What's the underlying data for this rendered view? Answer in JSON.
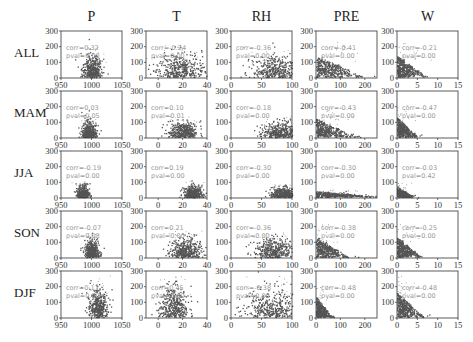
{
  "chart_data": {
    "type": "scatter",
    "title": "",
    "layout": {
      "rows": 5,
      "cols": 5,
      "grid": false,
      "legend": "none"
    },
    "col_titles": [
      "P",
      "T",
      "RH",
      "PRE",
      "W"
    ],
    "row_labels": [
      "ALL",
      "MAM",
      "JJA",
      "SON",
      "DJF"
    ],
    "ylim": [
      0,
      300
    ],
    "yticks": [
      0,
      100,
      200,
      300
    ],
    "xaxes": {
      "P": {
        "xlim": [
          950,
          1050
        ],
        "xticks": [
          950,
          1000,
          1050
        ]
      },
      "T": {
        "xlim": [
          -10,
          40
        ],
        "xticks": [
          0,
          20,
          40
        ]
      },
      "RH": {
        "xlim": [
          0,
          100
        ],
        "xticks": [
          0,
          50,
          100
        ]
      },
      "PRE": {
        "xlim": [
          0,
          250
        ],
        "xticks": [
          0,
          100,
          200
        ]
      },
      "W": {
        "xlim": [
          0,
          15
        ],
        "xticks": [
          0,
          5,
          10,
          15
        ]
      }
    },
    "panels": [
      {
        "row": "ALL",
        "col": "P",
        "corr": "0.32",
        "pval": "0.00"
      },
      {
        "row": "ALL",
        "col": "T",
        "corr": "-0.24",
        "pval": "0.00"
      },
      {
        "row": "ALL",
        "col": "RH",
        "corr": "-0.36",
        "pval": "0.00"
      },
      {
        "row": "ALL",
        "col": "PRE",
        "corr": "-0.41",
        "pval": "0.00"
      },
      {
        "row": "ALL",
        "col": "W",
        "corr": "-0.21",
        "pval": "0.00"
      },
      {
        "row": "MAM",
        "col": "P",
        "corr": "0.03",
        "pval": "0.05"
      },
      {
        "row": "MAM",
        "col": "T",
        "corr": "0.10",
        "pval": "0.01"
      },
      {
        "row": "MAM",
        "col": "RH",
        "corr": "-0.18",
        "pval": "0.00"
      },
      {
        "row": "MAM",
        "col": "PRE",
        "corr": "-0.43",
        "pval": "0.00"
      },
      {
        "row": "MAM",
        "col": "W",
        "corr": "-0.47",
        "pval": "0.00"
      },
      {
        "row": "JJA",
        "col": "P",
        "corr": "-0.19",
        "pval": "0.00"
      },
      {
        "row": "JJA",
        "col": "T",
        "corr": "0.19",
        "pval": "0.00"
      },
      {
        "row": "JJA",
        "col": "RH",
        "corr": "-0.30",
        "pval": "0.00"
      },
      {
        "row": "JJA",
        "col": "PRE",
        "corr": "-0.30",
        "pval": "0.00"
      },
      {
        "row": "JJA",
        "col": "W",
        "corr": "-0.03",
        "pval": "0.42"
      },
      {
        "row": "SON",
        "col": "P",
        "corr": "-0.07",
        "pval": "0.08"
      },
      {
        "row": "SON",
        "col": "T",
        "corr": "0.21",
        "pval": "0.00"
      },
      {
        "row": "SON",
        "col": "RH",
        "corr": "-0.36",
        "pval": "0.00"
      },
      {
        "row": "SON",
        "col": "PRE",
        "corr": "-0.38",
        "pval": "0.00"
      },
      {
        "row": "SON",
        "col": "W",
        "corr": "-0.25",
        "pval": "0.00"
      },
      {
        "row": "DJF",
        "col": "P",
        "corr": "0.17",
        "pval": "0.00"
      },
      {
        "row": "DJF",
        "col": "T",
        "corr": "0.45",
        "pval": "0.00"
      },
      {
        "row": "DJF",
        "col": "RH",
        "corr": "-0.38",
        "pval": "0.00"
      },
      {
        "row": "DJF",
        "col": "PRE",
        "corr": "-0.48",
        "pval": "0.00"
      },
      {
        "row": "DJF",
        "col": "W",
        "corr": "-0.48",
        "pval": "0.00"
      }
    ],
    "clusters": {
      "ALL": {
        "P": [
          1000,
          8,
          40,
          110
        ],
        "T": [
          18,
          10,
          50,
          120
        ],
        "RH": [
          75,
          22,
          40,
          110
        ],
        "PRE": [
          20,
          60,
          30,
          130
        ],
        "W": [
          2,
          2.2,
          40,
          130
        ]
      },
      "MAM": {
        "P": [
          995,
          6,
          30,
          80
        ],
        "T": [
          20,
          6,
          30,
          80
        ],
        "RH": [
          80,
          14,
          30,
          80
        ],
        "PRE": [
          20,
          50,
          30,
          110
        ],
        "W": [
          1.5,
          1.5,
          40,
          120
        ]
      },
      "JJA": {
        "P": [
          985,
          5,
          25,
          60
        ],
        "T": [
          28,
          4,
          25,
          60
        ],
        "RH": [
          85,
          10,
          20,
          50
        ],
        "PRE": [
          40,
          80,
          12,
          30
        ],
        "W": [
          1.5,
          1.2,
          25,
          55
        ]
      },
      "SON": {
        "P": [
          1000,
          6,
          35,
          90
        ],
        "T": [
          22,
          6,
          35,
          100
        ],
        "RH": [
          70,
          18,
          35,
          100
        ],
        "PRE": [
          15,
          40,
          30,
          120
        ],
        "W": [
          2,
          1.8,
          40,
          120
        ]
      },
      "DJF": {
        "P": [
          1010,
          8,
          60,
          150
        ],
        "T": [
          12,
          6,
          55,
          150
        ],
        "RH": [
          65,
          22,
          45,
          150
        ],
        "PRE": [
          5,
          20,
          30,
          120
        ],
        "W": [
          2,
          2,
          50,
          150
        ]
      }
    },
    "xlabel": "",
    "ylabel": "",
    "stat_labels": {
      "corr_prefix": "corr=",
      "pval_prefix": "pval="
    },
    "colors": {
      "points": "#555555",
      "outliers": "#999999",
      "stat_text": "#999999",
      "axes": "#333333"
    }
  }
}
